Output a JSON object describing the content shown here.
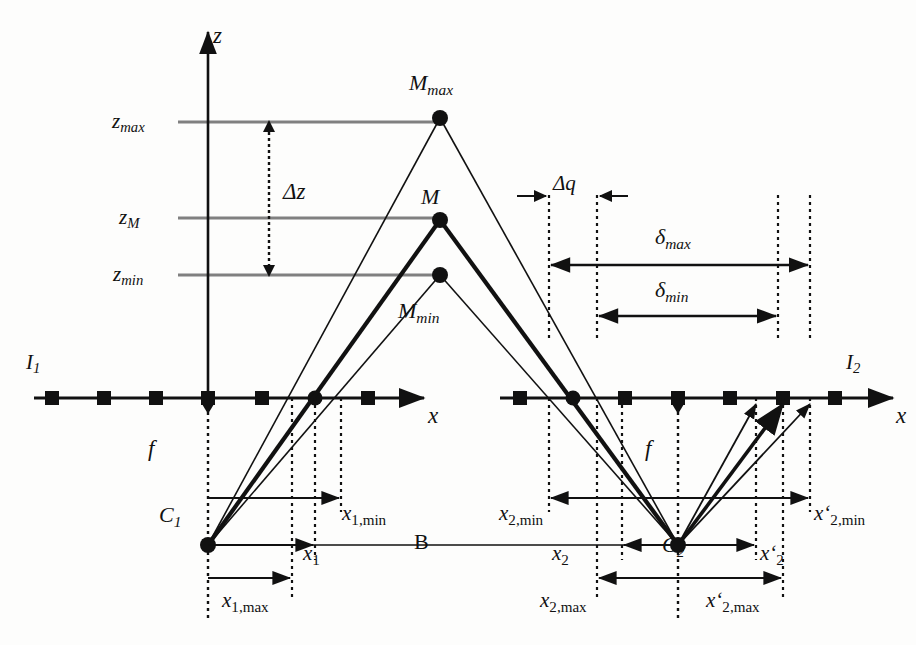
{
  "figure": {
    "kind": "stereo-triangulation-geometry-diagram",
    "background_color": "#fdfdfc",
    "ink_color": "#111111",
    "guide_color": "#7f7f7f"
  },
  "axes": {
    "z_axis_label": "z",
    "x_axis_label_left": "x",
    "x_axis_label_right": "x"
  },
  "height_levels": [
    {
      "id": "zmax",
      "base": "z",
      "sub": "max",
      "y": 122
    },
    {
      "id": "zM",
      "base": "z",
      "sub": "M",
      "y": 218
    },
    {
      "id": "zmin",
      "base": "z",
      "sub": "min",
      "y": 275
    }
  ],
  "points": [
    {
      "id": "Mmax",
      "base": "M",
      "sub": "max",
      "x": 440,
      "y": 118
    },
    {
      "id": "M",
      "base": "M",
      "sub": "",
      "x": 440,
      "y": 220
    },
    {
      "id": "Mmin",
      "base": "M",
      "sub": "min",
      "x": 440,
      "y": 275
    },
    {
      "id": "C1",
      "base": "C",
      "sub": "1",
      "x": 208,
      "y": 545
    },
    {
      "id": "C2",
      "base": "C",
      "sub": "2",
      "x": 678,
      "y": 545
    }
  ],
  "image_planes": [
    {
      "id": "I1",
      "base": "I",
      "sub": "1",
      "label_x": 24,
      "label_y": 360
    },
    {
      "id": "I2",
      "base": "I",
      "sub": "2",
      "label_x": 846,
      "label_y": 360
    }
  ],
  "focal_labels": [
    {
      "id": "f-left",
      "text": "f",
      "x": 150,
      "y": 440
    },
    {
      "id": "f-right",
      "text": "f",
      "x": 648,
      "y": 440
    }
  ],
  "measures": {
    "delta_z": {
      "base": "Δ",
      "rest": "z",
      "x": 238,
      "y": 188
    },
    "delta_q": {
      "base": "Δ",
      "rest": "q",
      "x": 560,
      "y": 182
    },
    "delta_max": {
      "base": "δ",
      "sub": "max",
      "x": 625,
      "y": 228
    },
    "delta_min": {
      "base": "δ",
      "sub": "min",
      "x": 637,
      "y": 285
    },
    "baseline": {
      "text": "B",
      "x": 420,
      "y": 535
    }
  },
  "offsets_left": [
    {
      "id": "x1min",
      "base": "x",
      "sub": "1,min",
      "x": 338,
      "y": 508
    },
    {
      "id": "x1",
      "base": "x",
      "sub": "1",
      "x": 306,
      "y": 540
    },
    {
      "id": "x1max",
      "base": "x",
      "sub": "1,max",
      "x": 283,
      "y": 590
    }
  ],
  "offsets_mid": [
    {
      "id": "x2min",
      "base": "x",
      "sub": "2,min",
      "x": 500,
      "y": 508
    },
    {
      "id": "x2",
      "base": "x",
      "sub": "2",
      "x": 556,
      "y": 540
    },
    {
      "id": "x2max",
      "base": "x",
      "sub": "2,max",
      "x": 540,
      "y": 590
    }
  ],
  "offsets_right": [
    {
      "id": "xp2min",
      "base": "x‘",
      "sub": "2,min",
      "x": 812,
      "y": 508
    },
    {
      "id": "xp2",
      "base": "x‘",
      "sub": "2",
      "x": 770,
      "y": 540
    },
    {
      "id": "xp2max",
      "base": "x‘",
      "sub": "2,max",
      "x": 712,
      "y": 590
    }
  ],
  "markers": {
    "left_plane_squares_x": [
      52,
      104,
      156,
      208,
      262,
      368
    ],
    "left_plane_circle_x": 315,
    "right_plane_squares_x": [
      520,
      625,
      678,
      730,
      783,
      835
    ],
    "right_plane_circle_x": 573,
    "plane_y": 398
  },
  "dotted_verticals": {
    "left": [
      208,
      292,
      315,
      341
    ],
    "right": [
      549,
      597,
      678,
      778,
      810
    ]
  }
}
